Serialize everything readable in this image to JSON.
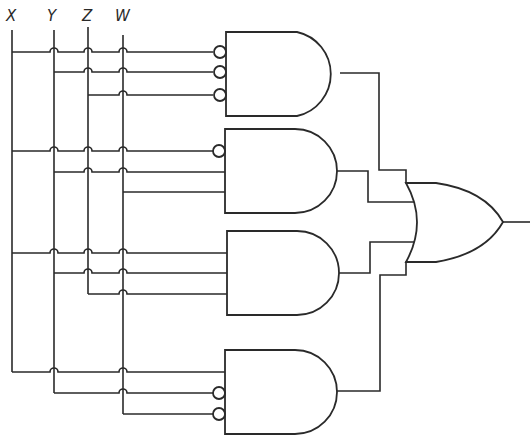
{
  "diagram": {
    "type": "logic-circuit",
    "inputs": [
      {
        "name": "X",
        "x": 12
      },
      {
        "name": "Y",
        "x": 54
      },
      {
        "name": "Z",
        "x": 88
      },
      {
        "name": "W",
        "x": 123
      }
    ],
    "gates": [
      {
        "id": "and1",
        "type": "AND",
        "inputs": [
          "X'",
          "Y'",
          "Z'"
        ]
      },
      {
        "id": "and2",
        "type": "AND",
        "inputs": [
          "X'",
          "Y",
          "W"
        ]
      },
      {
        "id": "and3",
        "type": "AND",
        "inputs": [
          "X",
          "Y",
          "Z"
        ]
      },
      {
        "id": "and4",
        "type": "AND",
        "inputs": [
          "X",
          "Y'",
          "W'"
        ]
      },
      {
        "id": "or1",
        "type": "OR",
        "inputs": [
          "and1",
          "and2",
          "and3",
          "and4"
        ]
      }
    ],
    "expression": "F = X'Y'Z' + X'YW + XYZ + XY'W'",
    "stroke_color": "#2a2a2a"
  }
}
